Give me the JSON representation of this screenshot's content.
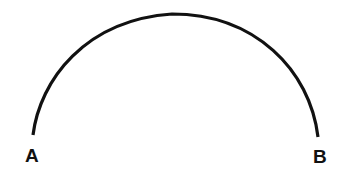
{
  "diagram": {
    "type": "arc",
    "stroke_color": "#111111",
    "background_color": "#ffffff",
    "points": [
      {
        "id": "A",
        "label": "A",
        "x": 33,
        "y": 135
      },
      {
        "id": "B",
        "label": "B",
        "x": 318,
        "y": 137
      }
    ],
    "arc_apex": {
      "x": 172,
      "y": 14
    }
  }
}
